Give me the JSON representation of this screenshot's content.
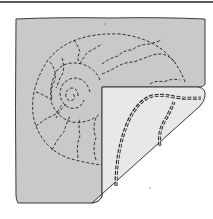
{
  "illustration": {
    "subject": "quilted ammonite shell square with folded corner",
    "colors": {
      "background": "#ffffff",
      "rule": "#5a5a5a",
      "quilt_face": "#c9c9c9",
      "quilt_back": "#e8e8e8",
      "outline": "#3a3a3a",
      "stitch": "#2a2a2a"
    }
  }
}
